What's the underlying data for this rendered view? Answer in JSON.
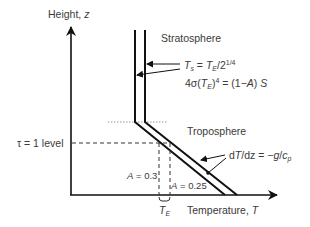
{
  "axes": {
    "y_label": "Height, ",
    "y_var": "z",
    "x_label": "Temperature, ",
    "x_var": "T"
  },
  "regions": {
    "upper": "Stratosphere",
    "lower": "Troposphere"
  },
  "equations": {
    "ts_lhs": "T",
    "ts_lhs_sub": "s",
    "ts_eq": " = ",
    "ts_rhs": "T",
    "ts_rhs_sub": "E",
    "ts_div": "/2",
    "ts_exp": "1/4",
    "energy_prefix": "4σ(",
    "energy_T": "T",
    "energy_T_sub": "E",
    "energy_close": ")",
    "energy_exp": "4",
    "energy_eq": " = (1−",
    "energy_A": "A",
    "energy_end": ") ",
    "energy_S": "S",
    "lapse_d": "d",
    "lapse_T": "T",
    "lapse_dz": "/dz = −",
    "lapse_g": "g",
    "lapse_slash": "/",
    "lapse_c": "c",
    "lapse_c_sub": "p"
  },
  "levels": {
    "tau": "τ = 1 level"
  },
  "albedo": {
    "left_A": "A",
    "left_val": " = 0.3",
    "right_A": "A",
    "right_val": " = 0.25"
  },
  "te_label": {
    "T": "T",
    "sub": "E"
  },
  "colors": {
    "line": "#111111",
    "dashed": "#333333",
    "dotted": "#999999",
    "text": "#3a3a3a"
  }
}
